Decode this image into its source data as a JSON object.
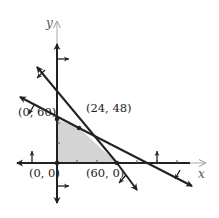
{
  "diagram": {
    "type": "linear-programming-feasible-region",
    "axes": {
      "x_label": "x",
      "y_label": "y"
    },
    "vertices": [
      {
        "id": "origin",
        "label": "(0, 0)",
        "x": 0,
        "y": 0
      },
      {
        "id": "y-intercept",
        "label": "(0, 60)",
        "x": 0,
        "y": 60
      },
      {
        "id": "intersection",
        "label": "(24, 48)",
        "x": 24,
        "y": 48
      },
      {
        "id": "x-intercept",
        "label": "(60, 0)",
        "x": 60,
        "y": 0
      }
    ],
    "constraint_lines": [
      {
        "id": "steep-line",
        "through": [
          "(24, 48)",
          "(60, 0)"
        ]
      },
      {
        "id": "shallow-line",
        "through": [
          "(0, 60)",
          "(24, 48)"
        ]
      }
    ],
    "colors": {
      "line": "#222222",
      "axis_arrow_tip": "#aaaaaa",
      "feasible_fill": "#d4d4d4"
    }
  }
}
